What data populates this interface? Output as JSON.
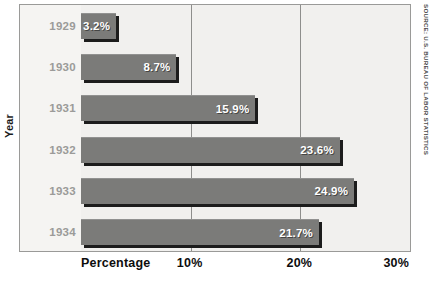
{
  "chart_data": {
    "type": "bar",
    "orientation": "horizontal",
    "title": "",
    "categories": [
      "1929",
      "1930",
      "1931",
      "1932",
      "1933",
      "1934"
    ],
    "values": [
      3.2,
      8.7,
      15.9,
      23.6,
      24.9,
      21.7
    ],
    "value_labels": [
      "3.2%",
      "8.7%",
      "15.9%",
      "23.6%",
      "24.9%",
      "21.7%"
    ],
    "xlabel": "Percentage",
    "ylabel": "Year",
    "xlim": [
      0,
      30
    ],
    "xticks": [
      0,
      10,
      20,
      30
    ],
    "xtick_labels": [
      "Percentage",
      "10%",
      "20%",
      "30%"
    ],
    "grid": true,
    "grid_axis": "x",
    "legend": "none",
    "source": "SOURCE: U.S. BUREAU OF LABOR STATISTICS",
    "colors": {
      "bar_fill": "#7b7b79",
      "bar_shadow": "#1c1c1c",
      "plot_background": "#f1f0ee",
      "label_column_background": "#f5f4f2",
      "gridline": "#8e8e8c",
      "frame_border": "#9a9a98",
      "year_label": "#9b9b99",
      "axis_text": "#0d0d0d",
      "value_label": "#ffffff",
      "source_text": "#4c4c4c"
    }
  },
  "axis": {
    "y_title": "Year",
    "x_ticks": [
      {
        "label": "Percentage",
        "value": 0
      },
      {
        "label": "10%",
        "value": 10
      },
      {
        "label": "20%",
        "value": 20
      },
      {
        "label": "30%",
        "value": 30
      }
    ]
  },
  "rows": [
    {
      "year": "1929",
      "value": 3.2,
      "label": "3.2%"
    },
    {
      "year": "1930",
      "value": 8.7,
      "label": "8.7%"
    },
    {
      "year": "1931",
      "value": 15.9,
      "label": "15.9%"
    },
    {
      "year": "1932",
      "value": 23.6,
      "label": "23.6%"
    },
    {
      "year": "1933",
      "value": 24.9,
      "label": "24.9%"
    },
    {
      "year": "1934",
      "value": 21.7,
      "label": "21.7%"
    }
  ],
  "source_note": "SOURCE: U.S. BUREAU OF LABOR STATISTICS",
  "title_cropped": ""
}
